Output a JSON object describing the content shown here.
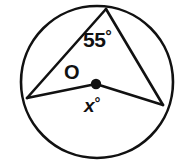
{
  "figure": {
    "background_color": "#ffffff",
    "stroke_color": "#111111",
    "circle": {
      "center_label": "O",
      "cx": 97,
      "cy": 82,
      "r": 76,
      "stroke_width": 2.6
    },
    "center_point": {
      "name": "O",
      "cx": 96,
      "cy": 84,
      "r": 5.2
    },
    "vertices": {
      "top": {
        "x": 106,
        "y": 9
      },
      "left": {
        "x": 27,
        "y": 98
      },
      "right": {
        "x": 163,
        "y": 105
      }
    },
    "segments": {
      "chord_top_left": "M 106 9 L 27 98",
      "chord_top_right": "M 106 9 L 163 105",
      "radius_center_left": "M 96 84 L 27 98",
      "radius_center_right": "M 96 84 L 163 105",
      "stroke_width": 2.6
    },
    "labels": {
      "inscribed_angle_value": "55",
      "inscribed_angle_unit": "°",
      "central_angle_value": "x",
      "central_angle_unit": "°",
      "center_label": "O"
    }
  }
}
